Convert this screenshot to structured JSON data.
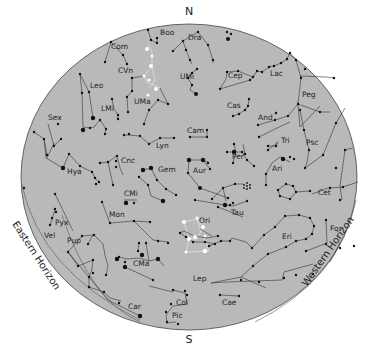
{
  "cardinals": {
    "north": "N",
    "south": "S"
  },
  "horizons": {
    "east": "Eastern Horizon",
    "west": "Western Horizon"
  },
  "colors": {
    "sky": "#b9b9b9",
    "star": "#111111",
    "line": "#333333",
    "highlight": "#ffffff",
    "border": "#444444"
  },
  "constellations": [
    {
      "abbr": "Boo",
      "x": 160,
      "y": 35
    },
    {
      "abbr": "Dra",
      "x": 188,
      "y": 40
    },
    {
      "abbr": "Com",
      "x": 111,
      "y": 49
    },
    {
      "abbr": "CVn",
      "x": 118,
      "y": 73
    },
    {
      "abbr": "UMi",
      "x": 180,
      "y": 79
    },
    {
      "abbr": "Leo",
      "x": 90,
      "y": 88
    },
    {
      "abbr": "UMa",
      "x": 134,
      "y": 104
    },
    {
      "abbr": "LMi",
      "x": 101,
      "y": 111
    },
    {
      "abbr": "Cep",
      "x": 228,
      "y": 78
    },
    {
      "abbr": "Lac",
      "x": 270,
      "y": 76
    },
    {
      "abbr": "Peg",
      "x": 302,
      "y": 97
    },
    {
      "abbr": "Cas",
      "x": 227,
      "y": 108
    },
    {
      "abbr": "And",
      "x": 258,
      "y": 120
    },
    {
      "abbr": "Sex",
      "x": 48,
      "y": 120
    },
    {
      "abbr": "Lyn",
      "x": 156,
      "y": 148
    },
    {
      "abbr": "Cam",
      "x": 187,
      "y": 133
    },
    {
      "abbr": "Tri",
      "x": 281,
      "y": 143
    },
    {
      "abbr": "Psc",
      "x": 306,
      "y": 145
    },
    {
      "abbr": "Per",
      "x": 232,
      "y": 159
    },
    {
      "abbr": "Cnc",
      "x": 121,
      "y": 163
    },
    {
      "abbr": "Hya",
      "x": 67,
      "y": 174
    },
    {
      "abbr": "Gem",
      "x": 158,
      "y": 172
    },
    {
      "abbr": "Aur",
      "x": 193,
      "y": 173
    },
    {
      "abbr": "Ari",
      "x": 272,
      "y": 171
    },
    {
      "abbr": "CMi",
      "x": 124,
      "y": 196
    },
    {
      "abbr": "Cet",
      "x": 318,
      "y": 195
    },
    {
      "abbr": "Tau",
      "x": 231,
      "y": 215
    },
    {
      "abbr": "Mon",
      "x": 109,
      "y": 217
    },
    {
      "abbr": "Ori",
      "x": 199,
      "y": 223
    },
    {
      "abbr": "Pyx",
      "x": 55,
      "y": 225
    },
    {
      "abbr": "Vel",
      "x": 44,
      "y": 238
    },
    {
      "abbr": "Pup",
      "x": 67,
      "y": 243
    },
    {
      "abbr": "Eri",
      "x": 282,
      "y": 239
    },
    {
      "abbr": "For",
      "x": 330,
      "y": 231
    },
    {
      "abbr": "CMa",
      "x": 133,
      "y": 266
    },
    {
      "abbr": "Lep",
      "x": 193,
      "y": 281
    },
    {
      "abbr": "Car",
      "x": 128,
      "y": 309
    },
    {
      "abbr": "Col",
      "x": 176,
      "y": 305
    },
    {
      "abbr": "Cae",
      "x": 222,
      "y": 305
    },
    {
      "abbr": "Pic",
      "x": 172,
      "y": 318
    }
  ]
}
